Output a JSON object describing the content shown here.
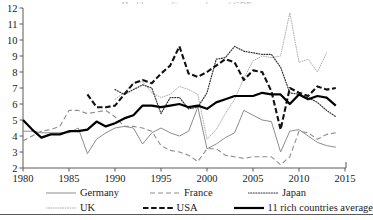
{
  "title_sliver": "Health expenditure as share of GDP",
  "axes": {
    "x_ticks": [
      "1980",
      "1985",
      "1990",
      "1995",
      "2000",
      "2005",
      "2010",
      "2015"
    ],
    "y_ticks": [
      "12",
      "11",
      "10",
      "9",
      "8",
      "7",
      "6",
      "5",
      "4",
      "3",
      "2"
    ]
  },
  "legend": {
    "items": [
      {
        "label": "Germany",
        "style": "thin-solid-gray",
        "color": "#8d8d8d"
      },
      {
        "label": "France",
        "style": "dashed-gray",
        "color": "#8d8d8d"
      },
      {
        "label": "Japan",
        "style": "dotted-dark",
        "color": "#333333"
      },
      {
        "label": "UK",
        "style": "fine-dotted-light",
        "color": "#b0b0b0"
      },
      {
        "label": "USA",
        "style": "bold-dashed-black",
        "color": "#111111"
      },
      {
        "label": "11 rich countries average",
        "style": "bold-solid-black",
        "color": "#000000"
      }
    ]
  },
  "chart_data": {
    "type": "line",
    "title": "Health expenditure as share of GDP",
    "xlabel": "",
    "ylabel": "",
    "xlim": [
      1980,
      2015
    ],
    "ylim": [
      2,
      12
    ],
    "grid": false,
    "legend_position": "below",
    "x_tick_step": 5,
    "y_tick_step": 1,
    "series": [
      {
        "name": "Germany",
        "color": "#8d8d8d",
        "style": "thin-solid-gray",
        "x": [
          1980,
          1981,
          1982,
          1983,
          1984,
          1985,
          1986,
          1987,
          1988,
          1989,
          1990,
          1991,
          1992,
          1993,
          1994,
          1995,
          1996,
          1997,
          1998,
          1999,
          2000,
          2001,
          2002,
          2003,
          2004,
          2005,
          2006,
          2007,
          2008,
          2009,
          2010,
          2011,
          2012,
          2013,
          2014
        ],
        "y": [
          4.3,
          4.3,
          4.2,
          4.2,
          4.2,
          4.2,
          4.5,
          2.9,
          3.8,
          4.2,
          4.5,
          4.6,
          4.5,
          3.5,
          4.2,
          4.5,
          4.2,
          4.0,
          4.3,
          5.8,
          3.2,
          3.5,
          3.9,
          4.2,
          5.6,
          5.3,
          5.0,
          4.9,
          3.0,
          4.3,
          4.4,
          4.0,
          3.6,
          3.4,
          3.3
        ]
      },
      {
        "name": "France",
        "color": "#8d8d8d",
        "style": "dashed-gray",
        "x": [
          1980,
          1981,
          1982,
          1983,
          1984,
          1985,
          1986,
          1987,
          1988,
          1989,
          1990,
          1991,
          1992,
          1993,
          1994,
          1995,
          1996,
          1997,
          1998,
          1999,
          2000,
          2001,
          2002,
          2003,
          2004,
          2005,
          2006,
          2007,
          2008,
          2009,
          2010,
          2011,
          2012,
          2013,
          2014
        ],
        "y": [
          3.7,
          4.0,
          4.3,
          4.4,
          4.6,
          5.6,
          5.6,
          5.4,
          5.5,
          5.6,
          5.2,
          4.6,
          4.6,
          4.5,
          4.3,
          3.4,
          3.1,
          3.0,
          2.8,
          2.4,
          3.2,
          3.2,
          2.8,
          2.7,
          2.6,
          2.7,
          2.7,
          2.7,
          2.2,
          2.7,
          4.3,
          4.2,
          3.8,
          4.1,
          4.2
        ]
      },
      {
        "name": "Japan",
        "color": "#333333",
        "style": "dotted-dark",
        "x": [
          1990,
          1991,
          1992,
          1993,
          1994,
          1995,
          1996,
          1997,
          1998,
          1999,
          2000,
          2001,
          2002,
          2003,
          2004,
          2005,
          2006,
          2007,
          2008,
          2009,
          2010,
          2011,
          2012,
          2013,
          2014
        ],
        "y": [
          6.9,
          6.6,
          6.9,
          7.2,
          7.0,
          5.4,
          6.4,
          6.4,
          5.7,
          5.8,
          6.7,
          8.8,
          8.9,
          9.6,
          9.3,
          9.2,
          9.1,
          9.1,
          8.3,
          6.7,
          6.6,
          6.4,
          6.1,
          5.6,
          5.2
        ]
      },
      {
        "name": "UK",
        "color": "#b0b0b0",
        "style": "fine-dotted-light",
        "x": [
          1990,
          1991,
          1992,
          1993,
          1994,
          1995,
          1996,
          1997,
          1998,
          1999,
          2000,
          2001,
          2002,
          2003,
          2004,
          2005,
          2006,
          2007,
          2008,
          2009,
          2010,
          2011,
          2012,
          2013
        ],
        "y": [
          6.3,
          6.7,
          7.3,
          7.4,
          6.7,
          6.4,
          6.6,
          7.1,
          6.9,
          6.6,
          3.8,
          4.4,
          5.4,
          6.3,
          7.6,
          8.7,
          9.0,
          8.9,
          9.0,
          11.7,
          8.6,
          8.8,
          8.0,
          9.2
        ]
      },
      {
        "name": "USA",
        "color": "#111111",
        "style": "bold-dashed-black",
        "x": [
          1987,
          1988,
          1989,
          1990,
          1991,
          1992,
          1993,
          1994,
          1995,
          1996,
          1997,
          1998,
          1999,
          2000,
          2001,
          2002,
          2003,
          2004,
          2005,
          2006,
          2007,
          2008,
          2009,
          2010,
          2011,
          2012,
          2013,
          2014
        ],
        "y": [
          6.6,
          5.8,
          5.8,
          5.9,
          6.6,
          7.3,
          7.5,
          7.3,
          7.9,
          8.4,
          9.6,
          7.9,
          7.7,
          8.0,
          8.4,
          8.8,
          8.6,
          7.5,
          8.1,
          8.0,
          6.8,
          4.4,
          7.0,
          6.7,
          6.5,
          7.1,
          6.9,
          7.0
        ]
      },
      {
        "name": "11 rich countries average",
        "color": "#000000",
        "style": "bold-solid-black",
        "x": [
          1980,
          1981,
          1982,
          1983,
          1984,
          1985,
          1986,
          1987,
          1988,
          1989,
          1990,
          1991,
          1992,
          1993,
          1994,
          1995,
          1996,
          1997,
          1998,
          1999,
          2000,
          2001,
          2002,
          2003,
          2004,
          2005,
          2006,
          2007,
          2008,
          2009,
          2010,
          2011,
          2012,
          2013,
          2014
        ],
        "y": [
          5.0,
          4.4,
          3.9,
          4.1,
          4.1,
          4.3,
          4.3,
          4.4,
          4.9,
          4.6,
          4.8,
          5.1,
          5.3,
          5.9,
          5.9,
          5.8,
          5.9,
          6.0,
          5.8,
          5.9,
          5.7,
          6.1,
          6.3,
          6.5,
          6.5,
          6.5,
          6.7,
          6.6,
          6.6,
          6.0,
          6.6,
          6.3,
          6.5,
          6.4,
          5.9
        ]
      }
    ]
  }
}
